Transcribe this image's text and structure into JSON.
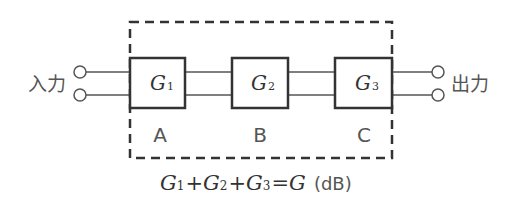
{
  "diagram": {
    "type": "cascaded-amplifier-block-diagram",
    "input_label": "入力",
    "output_label": "出力",
    "stages": [
      {
        "id": "A",
        "gain_symbol": "G",
        "gain_subscript": "1",
        "label": "A"
      },
      {
        "id": "B",
        "gain_symbol": "G",
        "gain_subscript": "2",
        "label": "B"
      },
      {
        "id": "C",
        "gain_symbol": "G",
        "gain_subscript": "3",
        "label": "C"
      }
    ],
    "formula": {
      "terms": [
        {
          "symbol": "G",
          "subscript": "1"
        },
        {
          "symbol": "G",
          "subscript": "2"
        },
        {
          "symbol": "G",
          "subscript": "3"
        }
      ],
      "plus": "+",
      "equals": "=",
      "result_symbol": "G",
      "unit": "(dB)"
    },
    "colors": {
      "line": "#333333",
      "dash": "#333333",
      "text": "#555555"
    }
  }
}
